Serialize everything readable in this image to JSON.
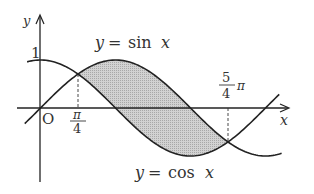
{
  "diagram": {
    "axes": {
      "x_label": "x",
      "y_label": "y",
      "origin_label": "O",
      "y_tick_label": "1"
    },
    "curves": [
      {
        "name": "sin",
        "label": "y = sin x",
        "label_prefix": "y",
        "label_eq": "=",
        "label_func": "sin",
        "label_var": "x"
      },
      {
        "name": "cos",
        "label": "y = cos x",
        "label_prefix": "y",
        "label_eq": "=",
        "label_func": "cos",
        "label_var": "x"
      }
    ],
    "x_marks": [
      {
        "value": "π/4",
        "numerator": "π",
        "denominator": "4"
      },
      {
        "value": "5/4 π",
        "numerator": "5",
        "denominator": "4",
        "suffix": "π"
      }
    ],
    "shaded_region": "between sin x and cos x from π/4 to 5π/4",
    "colors": {
      "line": "#222222",
      "shade": "#c8c8c8",
      "text": "#333333"
    }
  }
}
